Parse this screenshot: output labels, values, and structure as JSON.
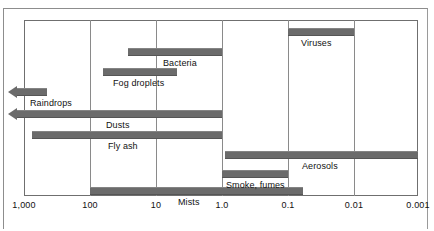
{
  "chart_data": {
    "type": "bar",
    "title": "",
    "xlabel": "",
    "ylabel": "",
    "orientation": "horizontal-ranges",
    "scale": "log-reversed",
    "grid": true,
    "legend": "none",
    "units": "micrometers",
    "xlim": [
      1000,
      0.001
    ],
    "tick_labels": [
      "1,000",
      "100",
      "10",
      "1.0",
      "0.1",
      "0.01",
      "0.001"
    ],
    "tick_values": [
      1000,
      100,
      10,
      1.0,
      0.1,
      0.01,
      0.001
    ],
    "categories": [
      "Viruses",
      "Bacteria",
      "Fog droplets",
      "Raindrops",
      "Dusts",
      "Fly ash",
      "Aerosols",
      "Smoke, fumes",
      "Mists"
    ],
    "ranges": [
      {
        "name": "Viruses",
        "min": 0.01,
        "max": 0.1,
        "open_left": false
      },
      {
        "name": "Bacteria",
        "min": 1.0,
        "max": 27,
        "open_left": false
      },
      {
        "name": "Fog droplets",
        "min": 5.5,
        "max": 63,
        "open_left": false
      },
      {
        "name": "Raindrops",
        "min": 330,
        "max": 1000,
        "open_left": true
      },
      {
        "name": "Dusts",
        "min": 1.0,
        "max": 1000,
        "open_left": true
      },
      {
        "name": "Fly ash",
        "min": 1.0,
        "max": 730,
        "open_left": false
      },
      {
        "name": "Aerosols",
        "min": 0.001,
        "max": 0.9,
        "open_left": false
      },
      {
        "name": "Smoke, fumes",
        "min": 0.1,
        "max": 1.0,
        "open_left": false
      },
      {
        "name": "Mists",
        "min": 0.062,
        "max": 100,
        "open_left": false
      }
    ]
  },
  "axis": {
    "ticks": [
      {
        "label": "1,000",
        "x": 24
      },
      {
        "label": "100",
        "x": 90
      },
      {
        "label": "10",
        "x": 156
      },
      {
        "label": "1.0",
        "x": 222
      },
      {
        "label": "0.1",
        "x": 288
      },
      {
        "label": "0.01",
        "x": 354
      },
      {
        "label": "0.001",
        "x": 418
      }
    ]
  },
  "bars": [
    {
      "name": "Viruses",
      "left": 288,
      "width": 66,
      "top": 28,
      "arrow": false,
      "label": "Viruses",
      "label_x": 301,
      "label_y": 38
    },
    {
      "name": "Bacteria",
      "left": 128,
      "width": 94,
      "top": 48,
      "arrow": false,
      "label": "Bacteria",
      "label_x": 163,
      "label_y": 58
    },
    {
      "name": "Fog droplets",
      "left": 103,
      "width": 74,
      "top": 68,
      "arrow": false,
      "label": "Fog droplets",
      "label_x": 113,
      "label_y": 78
    },
    {
      "name": "Raindrops",
      "left": 17,
      "width": 30,
      "top": 88,
      "arrow": true,
      "label": "Raindrops",
      "label_x": 30,
      "label_y": 98
    },
    {
      "name": "Dusts",
      "left": 17,
      "width": 205,
      "top": 110,
      "arrow": true,
      "label": "Dusts",
      "label_x": 106,
      "label_y": 120
    },
    {
      "name": "Fly ash",
      "left": 32,
      "width": 190,
      "top": 131,
      "arrow": false,
      "label": "Fly ash",
      "label_x": 108,
      "label_y": 141
    },
    {
      "name": "Aerosols",
      "left": 225,
      "width": 193,
      "top": 151,
      "arrow": false,
      "label": "Aerosols",
      "label_x": 302,
      "label_y": 161
    },
    {
      "name": "Smoke, fumes",
      "left": 222,
      "width": 66,
      "top": 170,
      "arrow": false,
      "label": "Smoke, fumes",
      "label_x": 226,
      "label_y": 180
    },
    {
      "name": "Mists",
      "left": 90,
      "width": 213,
      "top": 187,
      "arrow": false,
      "label": "Mists",
      "label_x": 178,
      "label_y": 197
    }
  ]
}
